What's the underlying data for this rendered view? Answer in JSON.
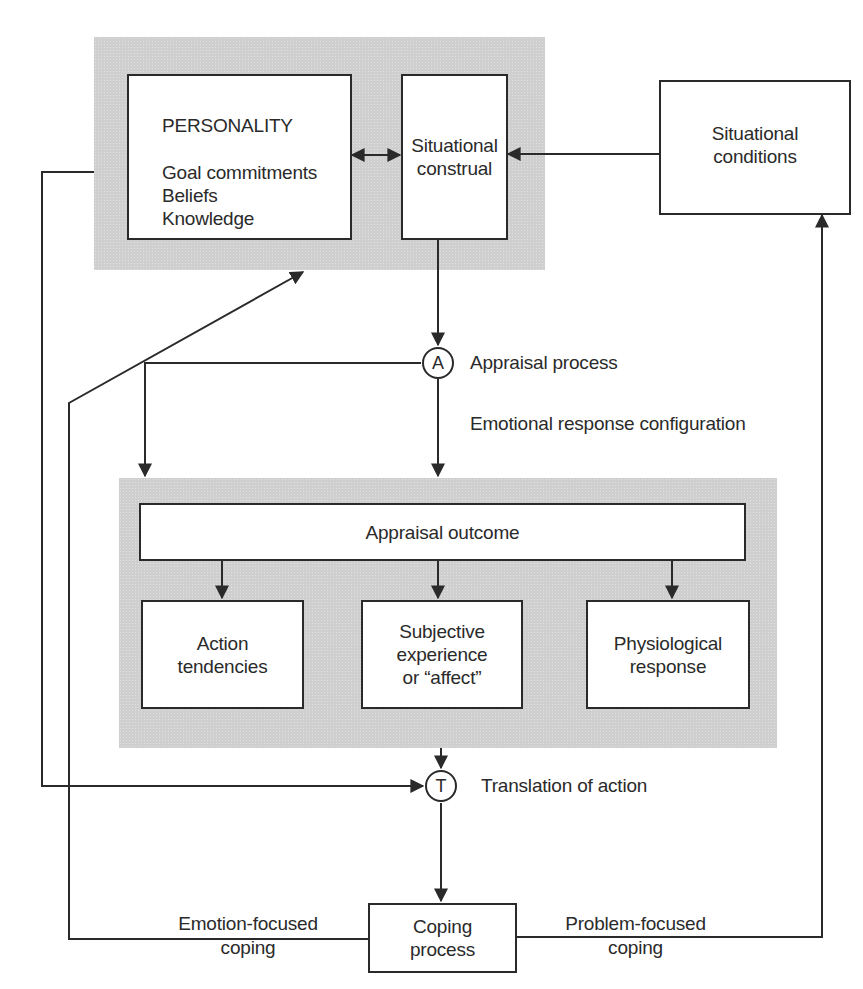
{
  "diagram": {
    "type": "flowchart",
    "top_panel": {
      "personality": {
        "title": "PERSONALITY",
        "items": [
          "Goal commitments",
          "Beliefs",
          "Knowledge"
        ]
      },
      "situational_construal": {
        "lines": [
          "Situational",
          "construal"
        ]
      }
    },
    "situational_conditions": {
      "lines": [
        "Situational",
        "conditions"
      ]
    },
    "nodes": {
      "appraisal": {
        "symbol": "A",
        "label": "Appraisal process"
      },
      "translation": {
        "symbol": "T",
        "label": "Translation of action"
      }
    },
    "emotional_response_label": "Emotional response configuration",
    "bottom_panel": {
      "appraisal_outcome": "Appraisal outcome",
      "outcomes": [
        {
          "lines": [
            "Action",
            "tendencies"
          ]
        },
        {
          "lines": [
            "Subjective",
            "experience",
            "or “affect”"
          ]
        },
        {
          "lines": [
            "Physiological",
            "response"
          ]
        }
      ]
    },
    "coping": {
      "box": {
        "lines": [
          "Coping",
          "process"
        ]
      },
      "emotion_focused": [
        "Emotion-focused",
        "coping"
      ],
      "problem_focused": [
        "Problem-focused",
        "coping"
      ]
    },
    "edges": [
      {
        "from": "Personality",
        "to": "Situational construal",
        "bidirectional": true
      },
      {
        "from": "Situational conditions",
        "to": "Situational construal"
      },
      {
        "from": "Situational construal",
        "to": "Appraisal process (A)"
      },
      {
        "from": "Appraisal process (A)",
        "to": "Emotional response configuration panel"
      },
      {
        "from": "Personality",
        "to": "Translation of action (T)"
      },
      {
        "from": "Emotional response configuration panel",
        "to": "Translation of action (T)"
      },
      {
        "from": "Translation of action (T)",
        "to": "Coping process"
      },
      {
        "from": "Coping process",
        "to": "Personality",
        "label": "Emotion-focused coping"
      },
      {
        "from": "Coping process",
        "to": "Situational conditions",
        "label": "Problem-focused coping"
      },
      {
        "from": "Appraisal outcome",
        "to": "Action tendencies"
      },
      {
        "from": "Appraisal outcome",
        "to": "Subjective experience or “affect”"
      },
      {
        "from": "Appraisal outcome",
        "to": "Physiological response"
      }
    ]
  }
}
